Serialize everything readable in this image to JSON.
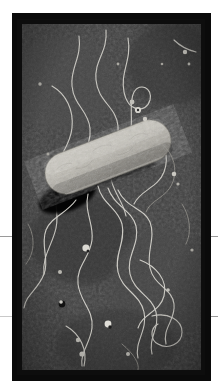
{
  "document": {
    "kind": "electron-micrograph-plate",
    "page_background": "#ffffff",
    "rules": [
      {
        "name": "rule-left-top",
        "y": 236,
        "side": "left",
        "color": "#9a9a9a"
      },
      {
        "name": "rule-left-bottom",
        "y": 316,
        "side": "left",
        "color": "#c9c9c9"
      },
      {
        "name": "rule-right-top",
        "y": 236,
        "side": "right",
        "color": "#9a9a9a"
      },
      {
        "name": "rule-right-bottom",
        "y": 316,
        "side": "right",
        "color": "#9a9a9a"
      }
    ]
  },
  "plate": {
    "frame_color": "#0a0a0a",
    "frame_x": 12,
    "frame_y": 13,
    "frame_width": 199,
    "frame_height": 368
  },
  "micrograph": {
    "name": "flagellated-rod-bacterium",
    "background_color": "#3b3b3b",
    "background_noise_color": "#2a2a2a",
    "vignette_color": "#262626",
    "field_width": 179,
    "field_height": 346,
    "cell": {
      "name": "bacterial-cell-body",
      "shape": "rod",
      "fill_color": "#b9b6ad",
      "fill_color_dark": "#97948c",
      "edge_color": "#6f6c66",
      "texture_color": "#a9a69d",
      "shadow_color": "#070707",
      "center_x": 86,
      "center_y": 133,
      "length": 132,
      "width": 42,
      "rotation_deg": -21
    },
    "flagella": {
      "name": "flagella-filaments",
      "color": "#cfcdc6",
      "color_dim": "#8e8c86",
      "count": 11,
      "stroke_width": 1.1
    },
    "debris": {
      "name": "stain-debris-particles",
      "bright_color": "#d8d6cf",
      "dark_color": "#141414",
      "count": 17
    }
  }
}
